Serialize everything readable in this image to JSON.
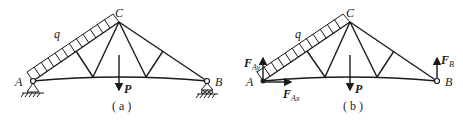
{
  "figures": [
    {
      "id": "a",
      "caption": "( a )",
      "labels": {
        "A": "A",
        "B": "B",
        "C": "C",
        "q": "q",
        "P": "P"
      },
      "supports": {
        "A": "pinned",
        "B": "roller"
      }
    },
    {
      "id": "b",
      "caption": "( b )",
      "labels": {
        "A": "A",
        "B": "B",
        "C": "C",
        "q": "q",
        "P": "P",
        "FAy_main": "F",
        "FAy_sub": "Ay",
        "FAx_main": "F",
        "FAx_sub": "Ax",
        "FB_main": "F",
        "FB_sub": "B"
      },
      "reactions": [
        "F_Ay (up at A)",
        "F_Ax (right at A)",
        "F_B (up at B)"
      ]
    }
  ]
}
